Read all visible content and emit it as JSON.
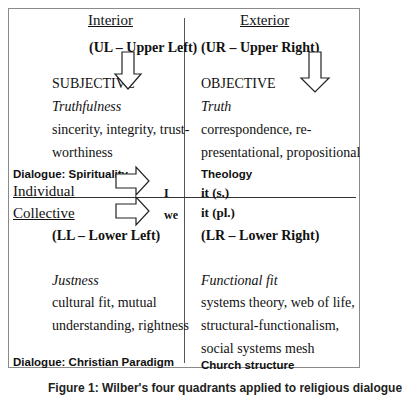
{
  "diagram": {
    "columns": {
      "interior": "Interior",
      "exterior": "Exterior"
    },
    "quadrants": {
      "ul": {
        "code": "(UL – Upper Left)",
        "category": "SUBJECTIVE",
        "validity": "Truthfulness",
        "lines": [
          "sincerity, integrity, trust-",
          "worthiness"
        ],
        "dialogue": "Dialogue: Spirituality"
      },
      "ur": {
        "code": "(UR – Upper Right)",
        "category": "OBJECTIVE",
        "validity": "Truth",
        "lines": [
          "correspondence, re-",
          "presentational, propositional"
        ],
        "dialogue": "Theology"
      },
      "ll": {
        "code": "(LL – Lower Left)",
        "validity": "Justness",
        "lines": [
          "cultural fit, mutual",
          "understanding, rightness"
        ],
        "dialogue": "Dialogue: Christian Paradigm"
      },
      "lr": {
        "code": "(LR – Lower Right)",
        "validity": "Functional fit",
        "lines": [
          "systems theory, web of life,",
          "structural-functionalism,",
          "social systems mesh"
        ],
        "dialogue": "Church structure"
      }
    },
    "rows": {
      "individual": "Individual",
      "individual_pronoun": "I",
      "individual_it": "it (s.)",
      "collective": "Collective",
      "collective_pronoun": "we",
      "collective_it": "it (pl.)"
    },
    "caption": "Figure 1: Wilber's four quadrants applied to religious dialogue"
  }
}
